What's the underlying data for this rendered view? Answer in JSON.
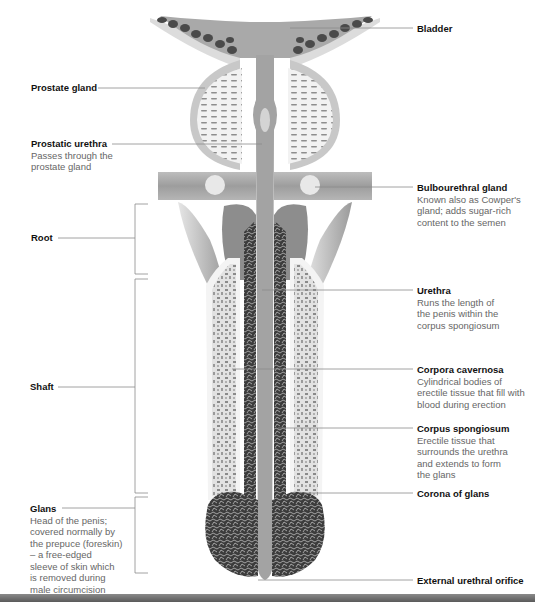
{
  "diagram": {
    "colors": {
      "background": "#ffffff",
      "tissue_light": "#d6d6d6",
      "tissue_mid": "#a8a8a8",
      "tissue_dark": "#4a4a4a",
      "leader_line": "#8c8c8c",
      "title_text": "#111111",
      "desc_text": "#666666",
      "bottom_bar": "#6e6e6e"
    },
    "labels_left": [
      {
        "id": "prostate-gland",
        "title": "Prostate gland",
        "desc": ""
      },
      {
        "id": "prostatic-urethra",
        "title": "Prostatic urethra",
        "desc_lines": [
          "Passes through the",
          "prostate gland"
        ]
      },
      {
        "id": "root",
        "title": "Root",
        "desc": ""
      },
      {
        "id": "shaft",
        "title": "Shaft",
        "desc": ""
      },
      {
        "id": "glans",
        "title": "Glans",
        "desc_lines": [
          "Head of the penis;",
          "covered normally by",
          "the prepuce (foreskin)",
          "– a free-edged",
          "sleeve of skin which",
          "is removed during",
          "male circumcision"
        ]
      }
    ],
    "labels_right": [
      {
        "id": "bladder",
        "title": "Bladder",
        "desc": ""
      },
      {
        "id": "bulbourethral-gland",
        "title": "Bulbourethral gland",
        "desc_lines": [
          "Known also as Cowper's",
          "gland; adds sugar-rich",
          "content to the semen"
        ]
      },
      {
        "id": "urethra",
        "title": "Urethra",
        "desc_lines": [
          "Runs the length of",
          "the penis within the",
          "corpus spongiosum"
        ]
      },
      {
        "id": "corpora-cavernosa",
        "title": "Corpora cavernosa",
        "desc_lines": [
          "Cylindrical bodies of",
          "erectile tissue that fill with",
          "blood during erection"
        ]
      },
      {
        "id": "corpus-spongiosum",
        "title": "Corpus spongiosum",
        "desc_lines": [
          "Erectile tissue that",
          "surrounds the urethra",
          "and extends to form",
          "the glans"
        ]
      },
      {
        "id": "corona-of-glans",
        "title": "Corona of glans",
        "desc": ""
      },
      {
        "id": "external-urethral-orifice",
        "title": "External urethral orifice",
        "desc": ""
      }
    ]
  }
}
